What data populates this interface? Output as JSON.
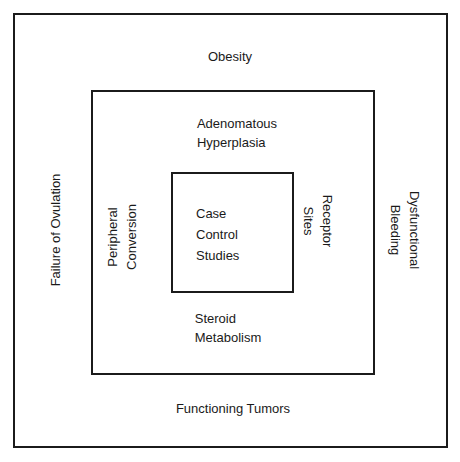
{
  "diagram": {
    "type": "nested-rectangles-concept-diagram",
    "background_color": "#ffffff",
    "line_color": "#1b1b1b",
    "text_color": "#1a1a1a",
    "boxes": [
      {
        "name": "outer",
        "level": 1
      },
      {
        "name": "middle",
        "level": 2
      },
      {
        "name": "inner",
        "level": 3
      }
    ],
    "labels": {
      "outer_top": "Obesity",
      "outer_bottom": "Functioning Tumors",
      "outer_left": "Failure of Ovulation",
      "outer_right": "Dysfunctional Bleeding",
      "middle_top": "Adenomatous\nHyperplasia",
      "middle_bottom": "Steroid\nMetabolism",
      "middle_left": "Peripheral\nConversion",
      "middle_right": "Receptor\nSites",
      "inner_center": "Case\nControl\nStudies"
    }
  }
}
